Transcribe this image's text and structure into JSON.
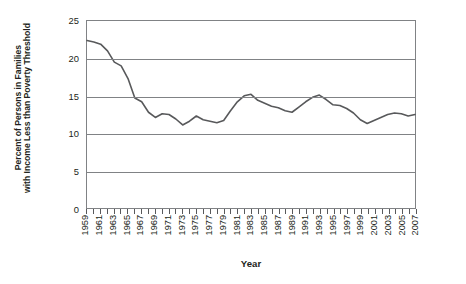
{
  "chart_data": {
    "type": "line",
    "title": "",
    "xlabel": "Year",
    "ylabel": "Percent of Persons in Families with Income Less than Poverty Threshold",
    "ylabel_lines": [
      "Percent of Persons in Families",
      "with Income Less than Poverty Threshold"
    ],
    "ylim": [
      0,
      25
    ],
    "y_ticks": [
      0,
      5,
      10,
      15,
      20,
      25
    ],
    "y_tick_labels": [
      "0",
      "5",
      "10",
      "15",
      "20",
      "25"
    ],
    "xlim": [
      1959,
      2007
    ],
    "grid": "horizontal",
    "legend": "none",
    "line_color": "#58595b",
    "axis_color": "#808285",
    "text_color": "#231f20",
    "x_tick_labels": [
      "1959",
      "1961",
      "1963",
      "1965",
      "1967",
      "1969",
      "1971",
      "1973",
      "1975",
      "1977",
      "1979",
      "1981",
      "1983",
      "1985",
      "1987",
      "1989",
      "1991",
      "1993",
      "1995",
      "1997",
      "1999",
      "2001",
      "2003",
      "2005",
      "2007"
    ],
    "x": [
      1959,
      1960,
      1961,
      1962,
      1963,
      1964,
      1965,
      1966,
      1967,
      1968,
      1969,
      1970,
      1971,
      1972,
      1973,
      1974,
      1975,
      1976,
      1977,
      1978,
      1979,
      1980,
      1981,
      1982,
      1983,
      1984,
      1985,
      1986,
      1987,
      1988,
      1989,
      1990,
      1991,
      1992,
      1993,
      1994,
      1995,
      1996,
      1997,
      1998,
      1999,
      2000,
      2001,
      2002,
      2003,
      2004,
      2005,
      2006,
      2007
    ],
    "values": [
      22.4,
      22.2,
      21.9,
      21.0,
      19.5,
      19.0,
      17.3,
      14.7,
      14.2,
      12.8,
      12.1,
      12.6,
      12.5,
      11.9,
      11.1,
      11.6,
      12.3,
      11.8,
      11.6,
      11.4,
      11.7,
      13.0,
      14.2,
      15.0,
      15.2,
      14.4,
      14.0,
      13.6,
      13.4,
      13.0,
      12.8,
      13.5,
      14.2,
      14.8,
      15.1,
      14.5,
      13.8,
      13.7,
      13.3,
      12.7,
      11.8,
      11.3,
      11.7,
      12.1,
      12.5,
      12.7,
      12.6,
      12.3,
      12.5
    ]
  },
  "axes": {
    "x_title": "Year"
  }
}
